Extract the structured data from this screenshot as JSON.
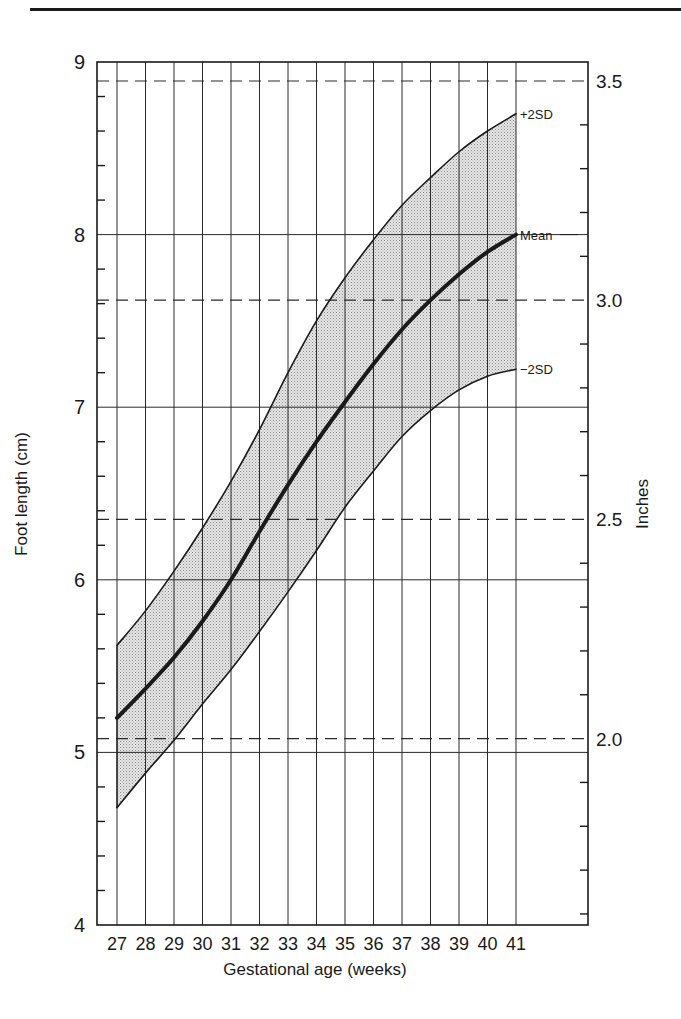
{
  "chart_data": {
    "type": "line",
    "title": "",
    "xlabel": "Gestational age (weeks)",
    "ylabel": "Foot length (cm)",
    "ylabel_right": "Inches",
    "x": [
      27,
      28,
      29,
      30,
      31,
      32,
      33,
      34,
      35,
      36,
      37,
      38,
      39,
      40,
      41
    ],
    "x_tick_labels": [
      "27",
      "28",
      "29",
      "30",
      "31",
      "32",
      "33",
      "34",
      "35",
      "36",
      "37",
      "38",
      "39",
      "40",
      "41"
    ],
    "xlim": [
      26.3,
      43.5
    ],
    "ylim": [
      4,
      9
    ],
    "y_tick_labels": [
      "4",
      "5",
      "6",
      "7",
      "8",
      "9"
    ],
    "y_ticks": [
      4,
      5,
      6,
      7,
      8,
      9
    ],
    "y_minor_step": 0.2,
    "right_axis": {
      "unit": "inches",
      "tick_labels": [
        "2.0",
        "2.5",
        "3.0",
        "3.5"
      ],
      "tick_values_in": [
        2.0,
        2.5,
        3.0,
        3.5
      ],
      "tick_values_cm": [
        5.08,
        6.35,
        7.62,
        8.89
      ],
      "minor_step_in": 0.1,
      "dashed_gridlines": true
    },
    "series": [
      {
        "name": "+2SD",
        "label": "+2SD",
        "style": "thin",
        "values": [
          5.62,
          5.82,
          6.05,
          6.3,
          6.57,
          6.87,
          7.2,
          7.5,
          7.75,
          7.97,
          8.17,
          8.33,
          8.48,
          8.6,
          8.7
        ]
      },
      {
        "name": "Mean",
        "label": "Mean",
        "style": "thick",
        "values": [
          5.2,
          5.37,
          5.55,
          5.76,
          6.0,
          6.28,
          6.55,
          6.8,
          7.03,
          7.25,
          7.45,
          7.62,
          7.77,
          7.9,
          8.0
        ]
      },
      {
        "name": "-2SD",
        "label": "−2SD",
        "style": "thin",
        "values": [
          4.68,
          4.88,
          5.07,
          5.28,
          5.48,
          5.7,
          5.93,
          6.17,
          6.42,
          6.63,
          6.83,
          6.98,
          7.1,
          7.18,
          7.22
        ]
      }
    ],
    "band": {
      "between": [
        "+2SD",
        "-2SD"
      ],
      "fill": "stippled grey"
    },
    "grid": {
      "vertical": true,
      "horizontal_major": true,
      "horizontal_inch_dashed": true
    },
    "legend": "inline labels at right end of curves"
  },
  "colors": {
    "ink": "#1a1a1a",
    "band_fill": "#c9c9c9",
    "grid": "#2a2a2a"
  }
}
